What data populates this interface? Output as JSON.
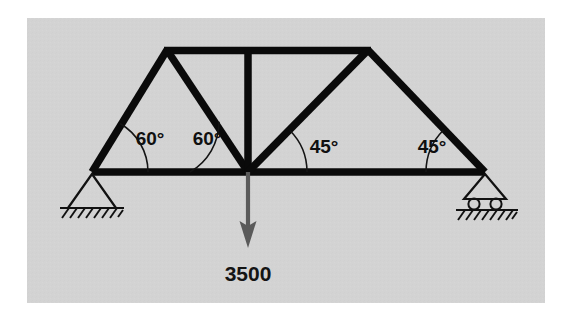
{
  "figure": {
    "type": "truss-free-body-diagram",
    "panel": {
      "background_color": "#d3d3d3",
      "page_color": "#ffffff",
      "x": 27,
      "y": 18,
      "width": 518,
      "height": 285
    },
    "line_color": "#0a0a0a",
    "load_color": "#5a5a5a"
  },
  "nodes": [
    {
      "id": "A",
      "name": "left-support-node",
      "x": 92,
      "y": 172
    },
    {
      "id": "B",
      "name": "center-bottom-node",
      "x": 248,
      "y": 172
    },
    {
      "id": "C",
      "name": "right-support-node",
      "x": 485,
      "y": 172
    },
    {
      "id": "D",
      "name": "top-left-node",
      "x": 167,
      "y": 50
    },
    {
      "id": "E",
      "name": "top-right-node",
      "x": 368,
      "y": 50
    }
  ],
  "members": [
    {
      "name": "bottom-chord-left",
      "from": "A",
      "to": "B"
    },
    {
      "name": "bottom-chord-right",
      "from": "B",
      "to": "C"
    },
    {
      "name": "top-chord",
      "from": "D",
      "to": "E"
    },
    {
      "name": "left-end-post",
      "from": "A",
      "to": "D"
    },
    {
      "name": "left-diagonal",
      "from": "D",
      "to": "B"
    },
    {
      "name": "center-vertical",
      "from": "B",
      "to": "top-chord-midpoint"
    },
    {
      "name": "right-diagonal",
      "from": "B",
      "to": "E"
    },
    {
      "name": "right-end-post",
      "from": "E",
      "to": "C"
    }
  ],
  "angles": [
    {
      "name": "angle-left-support",
      "label": "60°",
      "value": 60,
      "vertex": "A",
      "label_x": 150,
      "label_y": 140
    },
    {
      "name": "angle-center-left",
      "label": "60°",
      "value": 60,
      "vertex": "B",
      "label_x": 207,
      "label_y": 140
    },
    {
      "name": "angle-center-right",
      "label": "45°",
      "value": 45,
      "vertex": "B",
      "label_x": 324,
      "label_y": 148
    },
    {
      "name": "angle-right-support",
      "label": "45°",
      "value": 45,
      "vertex": "C",
      "label_x": 432,
      "label_y": 148
    }
  ],
  "load": {
    "name": "applied-load",
    "label": "3500",
    "magnitude": 3500,
    "direction": "down",
    "applied_at": "B",
    "arrow_start_y": 172,
    "arrow_end_y": 246,
    "label_x": 248,
    "label_y": 274
  },
  "supports": [
    {
      "name": "pin-support",
      "type": "pin",
      "at": "A",
      "hatching": true,
      "rollers": 0
    },
    {
      "name": "roller-support",
      "type": "roller",
      "at": "C",
      "hatching": true,
      "rollers": 2
    }
  ]
}
